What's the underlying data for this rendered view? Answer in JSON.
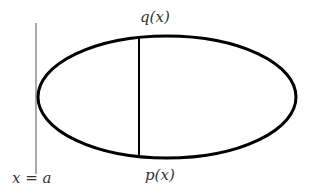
{
  "diagram": {
    "type": "region-between-curves",
    "labels": {
      "upper_curve": "q(x)",
      "lower_curve": "p(x)",
      "boundary_line": "x = a"
    },
    "shapes": {
      "ellipse": {
        "cx": 167,
        "cy": 97,
        "rx": 129,
        "ry": 61,
        "stroke": "#000000",
        "stroke_width": 3
      },
      "chord": {
        "x": 139,
        "y1": 38,
        "y2": 157,
        "stroke": "#000000",
        "stroke_width": 2
      },
      "boundary_line": {
        "x": 36,
        "y1": 23,
        "y2": 174,
        "stroke": "#555555",
        "stroke_width": 1
      }
    },
    "colors": {
      "background": "#ffffff",
      "curve": "#000000",
      "text": "#333333"
    }
  }
}
